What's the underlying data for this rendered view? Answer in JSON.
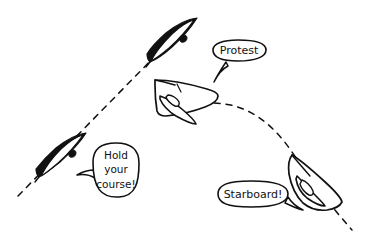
{
  "illustration": {
    "title": "Sailing right-of-way cartoon",
    "style": "hand-drawn ink sketch",
    "background_color": "#ffffff",
    "ink_color": "#111111"
  },
  "boats": [
    {
      "id": "boat-upper-left-black",
      "label": "Port-tack black boat (upper)",
      "fill": "solid-black",
      "heading": "up-right",
      "on_track": "straight-dashed-track"
    },
    {
      "id": "boat-lower-left-black",
      "label": "Port-tack black boat (lower)",
      "fill": "solid-black",
      "heading": "up-right",
      "on_track": "straight-dashed-track"
    },
    {
      "id": "boat-middle-white",
      "label": "Starboard-tack white boat (protesting)",
      "fill": "outline-white",
      "heading": "left",
      "on_track": "curved-dashed-track"
    },
    {
      "id": "boat-lower-right-white",
      "label": "Starboard-tack white boat (hailing)",
      "fill": "outline-white",
      "heading": "up-left",
      "on_track": "curved-dashed-track"
    }
  ],
  "tracks": [
    {
      "id": "straight-dashed-track",
      "label": "Straight dashed course line",
      "shape": "straight",
      "direction": "from lower-left to upper-right",
      "dashed": true
    },
    {
      "id": "curved-dashed-track",
      "label": "Curved dashed course line",
      "shape": "arc",
      "direction": "from upper-left, arcing over, down to lower-right",
      "dashed": true
    }
  ],
  "bubbles": [
    {
      "id": "bubble-protest",
      "speaker": "boat-middle-white",
      "lines": [
        "Protest"
      ],
      "tail_direction": "down-left"
    },
    {
      "id": "bubble-hold-your-course",
      "speaker": "boat-lower-left-black",
      "lines": [
        "Hold",
        "your",
        "course!"
      ],
      "tail_direction": "left"
    },
    {
      "id": "bubble-starboard",
      "speaker": "boat-lower-right-white",
      "lines": [
        "Starboard!"
      ],
      "tail_direction": "right"
    }
  ]
}
